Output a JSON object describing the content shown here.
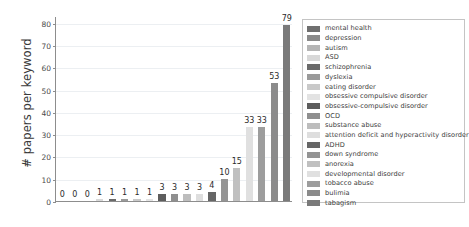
{
  "chart_data": {
    "type": "bar",
    "title": "",
    "xlabel": "",
    "ylabel": "# papers per keyword",
    "ylim": [
      0,
      83
    ],
    "yticks": [
      0,
      10,
      20,
      30,
      40,
      50,
      60,
      70,
      80
    ],
    "ytick_labels": [
      "0",
      "10",
      "20",
      "30",
      "40",
      "50",
      "60",
      "70",
      "80"
    ],
    "grid": true,
    "xtick_labels": [],
    "legend_position": "right",
    "categories": [
      "mental health",
      "depression",
      "autism",
      "ASD",
      "schizophrenia",
      "dyslexia",
      "eating disorder",
      "obsessive compulsive disorder",
      "obsessive-compulsive disorder",
      "OCD",
      "substance abuse",
      "attention deficit and hyperactivity disorder",
      "ADHD",
      "down syndrome",
      "anorexia",
      "developmental disorder",
      "tobacco abuse",
      "bulimia",
      "tabagism"
    ],
    "values": [
      0,
      0,
      0,
      1,
      1,
      1,
      1,
      1,
      3,
      3,
      3,
      3,
      4,
      10,
      15,
      33,
      33,
      53,
      79
    ],
    "value_labels": [
      "0",
      "0",
      "0",
      "1",
      "1",
      "1",
      "1",
      "1",
      "3",
      "3",
      "3",
      "3",
      "4",
      "10",
      "15",
      "33",
      "33",
      "53",
      "79"
    ],
    "bar_colors": [
      "#6f6f6f",
      "#8a8a8a",
      "#b5b5b5",
      "#d8d8d8",
      "#6a6a6a",
      "#9a9a9a",
      "#c9c9c9",
      "#e3e3e3",
      "#5d5d5d",
      "#8f8f8f",
      "#bdbdbd",
      "#dedede",
      "#666666",
      "#949494",
      "#c0c0c0",
      "#e0e0e0",
      "#9d9d9d",
      "#8b8b8b",
      "#7a7a7a"
    ]
  },
  "legend": {
    "entries": [
      {
        "label": "mental health",
        "color": "#6f6f6f"
      },
      {
        "label": "depression",
        "color": "#8a8a8a"
      },
      {
        "label": "autism",
        "color": "#b5b5b5"
      },
      {
        "label": "ASD",
        "color": "#d8d8d8"
      },
      {
        "label": "schizophrenia",
        "color": "#6a6a6a"
      },
      {
        "label": "dyslexia",
        "color": "#9a9a9a"
      },
      {
        "label": "eating disorder",
        "color": "#c9c9c9"
      },
      {
        "label": "obsessive compulsive disorder",
        "color": "#e3e3e3"
      },
      {
        "label": "obsessive-compulsive disorder",
        "color": "#5d5d5d"
      },
      {
        "label": "OCD",
        "color": "#8f8f8f"
      },
      {
        "label": "substance abuse",
        "color": "#bdbdbd"
      },
      {
        "label": "attention deficit and hyperactivity disorder",
        "color": "#dedede"
      },
      {
        "label": "ADHD",
        "color": "#666666"
      },
      {
        "label": "down syndrome",
        "color": "#949494"
      },
      {
        "label": "anorexia",
        "color": "#c0c0c0"
      },
      {
        "label": "developmental disorder",
        "color": "#e0e0e0"
      },
      {
        "label": "tobacco abuse",
        "color": "#9d9d9d"
      },
      {
        "label": "bulimia",
        "color": "#8b8b8b"
      },
      {
        "label": "tabagism",
        "color": "#7a7a7a"
      }
    ]
  },
  "axes": {
    "y_title": "# papers per keyword",
    "axis_color": "#8d8d8d",
    "grid_color": "#eceff2"
  }
}
